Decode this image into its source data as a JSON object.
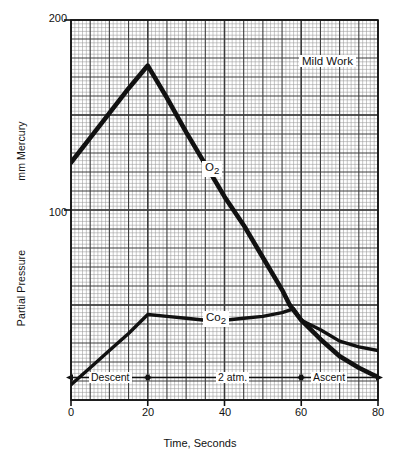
{
  "chart_data": {
    "type": "line",
    "title": "",
    "annotations": [
      {
        "name": "mild-work",
        "text": "Mild Work",
        "x": 68,
        "y": 182
      },
      {
        "name": "o2-series-label",
        "text": "O",
        "sub": "2",
        "x": 36,
        "y": 143
      },
      {
        "name": "co2-series-label",
        "text": "Co",
        "sub": "2",
        "x": 37,
        "y": 45
      }
    ],
    "xlabel": "Time, Seconds",
    "ylabel_upper": "mm Mercury",
    "ylabel_lower": "Partial Pressure",
    "xlim": [
      0,
      80
    ],
    "ylim": [
      0,
      200
    ],
    "xticks": [
      "0",
      "20",
      "40",
      "60",
      "80"
    ],
    "xtick_values": [
      0,
      20,
      40,
      60,
      80
    ],
    "yticks": [
      "100",
      "200"
    ],
    "ytick_values": [
      100,
      200
    ],
    "grid": true,
    "grid_major_x": 5,
    "grid_major_y": 10,
    "grid_minor_x": 1,
    "grid_minor_y": 2,
    "legend": "inline-labels",
    "series": [
      {
        "name": "O2",
        "label": "O",
        "sub": "2",
        "x": [
          0,
          5,
          10,
          15,
          20,
          25,
          30,
          35,
          40,
          45,
          50,
          55,
          57,
          60,
          65,
          70,
          75,
          80
        ],
        "values": [
          125,
          138,
          151,
          164,
          176,
          159,
          141,
          124,
          107,
          92,
          75,
          58,
          50,
          42,
          32,
          23,
          17,
          12
        ]
      },
      {
        "name": "CO2",
        "label": "Co",
        "sub": "2",
        "x": [
          0,
          5,
          10,
          15,
          20,
          25,
          30,
          35,
          40,
          45,
          50,
          55,
          58,
          60,
          65,
          70,
          75,
          80
        ],
        "values": [
          8,
          17,
          26,
          35,
          45,
          44,
          43,
          42,
          42,
          43,
          44,
          46,
          48,
          42,
          37,
          31,
          28,
          26
        ]
      }
    ],
    "phase_bands": [
      {
        "name": "descent",
        "label": "Descent",
        "x_start": 0,
        "x_end": 20,
        "arrow": "both"
      },
      {
        "name": "2atm",
        "label": "2 atm.",
        "x_start": 20,
        "x_end": 60,
        "arrow": "both"
      },
      {
        "name": "ascent",
        "label": "Ascent",
        "x_start": 60,
        "x_end": 80,
        "arrow": "both"
      }
    ],
    "colors": {
      "series_line": "#111111",
      "grid_major": "#3a3a3a",
      "grid_minor": "#8a8a8a",
      "axis": "#111111",
      "background": "#ffffff"
    }
  },
  "axes": {
    "y_upper_title": "mm Mercury",
    "y_lower_title": "Partial Pressure",
    "x_title": "Time, Seconds",
    "ytick_200": "200",
    "ytick_100": "100",
    "xtick_0": "0",
    "xtick_20": "20",
    "xtick_40": "40",
    "xtick_60": "60",
    "xtick_80": "80"
  },
  "labels": {
    "mild_work": "Mild Work",
    "o2_main": "O",
    "o2_sub": "2",
    "co2_main": "Co",
    "co2_sub": "2",
    "descent": "Descent",
    "two_atm": "2 atm.",
    "ascent": "Ascent"
  }
}
